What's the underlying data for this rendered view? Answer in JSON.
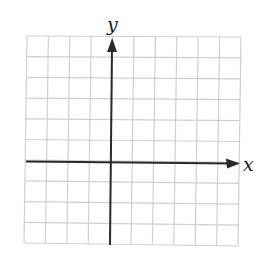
{
  "diagram": {
    "type": "coordinate-grid",
    "grid": {
      "columns": 10,
      "rows": 10,
      "color": "#cfcfcf"
    },
    "axes": {
      "x_label": "x",
      "y_label": "y",
      "origin_column": 4,
      "origin_row": 6,
      "color": "#2a2a2a"
    }
  }
}
